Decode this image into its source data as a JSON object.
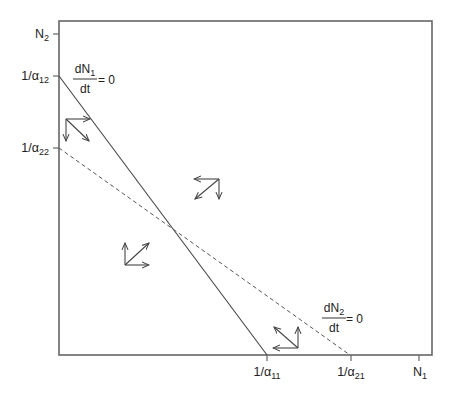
{
  "figure": {
    "type": "phase-plane"
  },
  "axes": {
    "y_axis": {
      "max_label": {
        "main": "N",
        "sub": "2"
      },
      "ticks": [
        {
          "id": "n2",
          "main": "N",
          "sub": "2",
          "y": 34
        },
        {
          "id": "inv-a12",
          "main": "1/α",
          "sub": "12",
          "y": 76
        },
        {
          "id": "inv-a22",
          "main": "1/α",
          "sub": "22",
          "y": 148
        }
      ]
    },
    "x_axis": {
      "ticks": [
        {
          "id": "inv-a11",
          "main": "1/α",
          "sub": "11",
          "x": 267
        },
        {
          "id": "inv-a21",
          "main": "1/α",
          "sub": "21",
          "x": 351
        },
        {
          "id": "n1",
          "main": "N",
          "sub": "1",
          "x": 419
        }
      ]
    }
  },
  "isoclines": {
    "n1": {
      "style": "solid",
      "numerator_main": "dN",
      "numerator_sub": "1",
      "denominator": "dt",
      "equals": "= 0",
      "from": [
        59,
        76
      ],
      "to": [
        267,
        355
      ]
    },
    "n2": {
      "style": "dashed",
      "numerator_main": "dN",
      "numerator_sub": "2",
      "denominator": "dt",
      "equals": "= 0",
      "from": [
        59,
        148
      ],
      "to": [
        350,
        355
      ]
    }
  },
  "vector_groups": [
    {
      "id": "upper-left",
      "origin": [
        66,
        119
      ],
      "components": [
        "right",
        "down",
        "down-right"
      ]
    },
    {
      "id": "upper-right",
      "origin": [
        219,
        179
      ],
      "components": [
        "left",
        "down",
        "down-left"
      ]
    },
    {
      "id": "lower-left",
      "origin": [
        125,
        265
      ],
      "components": [
        "up",
        "right",
        "up-right"
      ]
    },
    {
      "id": "lower-right",
      "origin": [
        298,
        348
      ],
      "components": [
        "left",
        "up",
        "up-left"
      ]
    }
  ],
  "colors": {
    "frame": "#666666",
    "lines": "#444444",
    "text": "#222222"
  }
}
